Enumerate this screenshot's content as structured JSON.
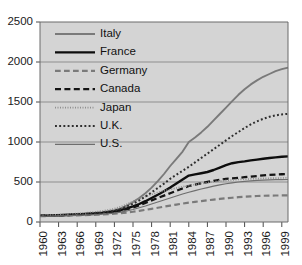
{
  "chart_data": {
    "type": "line",
    "title": "",
    "subtitle": "",
    "xlabel": "",
    "ylabel": "",
    "xlim": [
      1960,
      2000
    ],
    "ylim": [
      0,
      2500
    ],
    "grid": true,
    "legend_position": "top-left-inside",
    "y_ticks": [
      0,
      500,
      1000,
      1500,
      2000,
      2500
    ],
    "y_tick_labels": [
      "0",
      "500",
      "1000",
      "1500",
      "2000",
      "2500"
    ],
    "x_ticks": [
      1960,
      1963,
      1966,
      1969,
      1972,
      1975,
      1978,
      1981,
      1984,
      1987,
      1990,
      1993,
      1996,
      1999
    ],
    "x_tick_labels": [
      "1960",
      "1963",
      "1966",
      "1969",
      "1972",
      "1975",
      "1978",
      "1981",
      "1984",
      "1987",
      "1990",
      "1993",
      "1996",
      "1999"
    ],
    "x": [
      1960,
      1961,
      1962,
      1963,
      1964,
      1965,
      1966,
      1967,
      1968,
      1969,
      1970,
      1971,
      1972,
      1973,
      1974,
      1975,
      1976,
      1977,
      1978,
      1979,
      1980,
      1981,
      1982,
      1983,
      1984,
      1985,
      1986,
      1987,
      1988,
      1989,
      1990,
      1991,
      1992,
      1993,
      1994,
      1995,
      1996,
      1997,
      1998,
      1999,
      2000
    ],
    "series": [
      {
        "name": "Italy",
        "color": "#7a7a7a",
        "style": "solid",
        "width": 1.9,
        "values": [
          80,
          82,
          85,
          88,
          92,
          96,
          100,
          105,
          110,
          116,
          124,
          134,
          148,
          170,
          205,
          250,
          300,
          360,
          430,
          510,
          600,
          700,
          790,
          880,
          1000,
          1055,
          1120,
          1190,
          1270,
          1350,
          1430,
          1510,
          1590,
          1660,
          1720,
          1770,
          1815,
          1850,
          1885,
          1910,
          1930
        ]
      },
      {
        "name": "France",
        "color": "#0d0d0d",
        "style": "solid",
        "width": 2.4,
        "values": [
          78,
          80,
          82,
          85,
          88,
          91,
          95,
          99,
          103,
          108,
          114,
          122,
          132,
          148,
          170,
          196,
          225,
          260,
          300,
          340,
          385,
          430,
          480,
          530,
          580,
          595,
          610,
          625,
          650,
          680,
          710,
          735,
          748,
          758,
          770,
          780,
          790,
          800,
          808,
          815,
          820
        ]
      },
      {
        "name": "Germany",
        "color": "#7a7a7a",
        "style": "dashed",
        "width": 2.2,
        "values": [
          72,
          74,
          76,
          78,
          80,
          82,
          84,
          86,
          88,
          91,
          94,
          98,
          103,
          110,
          118,
          128,
          140,
          152,
          165,
          178,
          192,
          205,
          218,
          230,
          242,
          252,
          262,
          272,
          280,
          288,
          296,
          303,
          310,
          316,
          321,
          325,
          328,
          330,
          331,
          332,
          333
        ]
      },
      {
        "name": "Canada",
        "color": "#141414",
        "style": "dashed",
        "width": 2.3,
        "values": [
          76,
          78,
          80,
          82,
          85,
          88,
          91,
          95,
          99,
          104,
          110,
          118,
          128,
          142,
          160,
          182,
          208,
          238,
          270,
          300,
          330,
          360,
          390,
          420,
          450,
          468,
          485,
          500,
          515,
          528,
          538,
          545,
          552,
          560,
          568,
          575,
          582,
          588,
          593,
          597,
          600
        ]
      },
      {
        "name": "Japan",
        "color": "#8f8f8f",
        "style": "dotted-fine",
        "width": 1.7,
        "values": [
          82,
          85,
          88,
          92,
          96,
          101,
          106,
          112,
          119,
          127,
          137,
          150,
          166,
          190,
          222,
          258,
          290,
          318,
          345,
          368,
          390,
          408,
          425,
          440,
          455,
          468,
          480,
          492,
          503,
          512,
          520,
          526,
          531,
          535,
          539,
          542,
          545,
          547,
          549,
          550,
          551
        ]
      },
      {
        "name": "U.K.",
        "color": "#2e2e2e",
        "style": "dotted",
        "width": 2.0,
        "values": [
          75,
          77,
          80,
          83,
          86,
          90,
          94,
          99,
          104,
          110,
          118,
          128,
          142,
          162,
          192,
          228,
          270,
          318,
          370,
          425,
          480,
          540,
          590,
          640,
          690,
          745,
          800,
          855,
          910,
          965,
          1020,
          1075,
          1125,
          1175,
          1220,
          1258,
          1290,
          1315,
          1333,
          1345,
          1352
        ]
      },
      {
        "name": "U.S.",
        "color": "#6e6e6e",
        "style": "solid",
        "width": 1.2,
        "values": [
          70,
          72,
          74,
          76,
          78,
          80,
          83,
          86,
          89,
          93,
          98,
          104,
          112,
          123,
          138,
          156,
          178,
          200,
          225,
          250,
          275,
          300,
          325,
          350,
          372,
          392,
          412,
          430,
          448,
          463,
          478,
          490,
          500,
          508,
          515,
          520,
          524,
          527,
          529,
          530,
          531
        ]
      }
    ]
  },
  "legend": {
    "entries": [
      {
        "label": "Italy"
      },
      {
        "label": "France"
      },
      {
        "label": "Germany"
      },
      {
        "label": "Canada"
      },
      {
        "label": "Japan"
      },
      {
        "label": "U.K."
      },
      {
        "label": "U.S."
      }
    ]
  },
  "colors": {
    "plot_background": "#d4d4d4",
    "page_background": "#ffffff",
    "gridline": "#8e8e8e",
    "axis": "#6a6a6a",
    "text": "#1a1a1a"
  }
}
